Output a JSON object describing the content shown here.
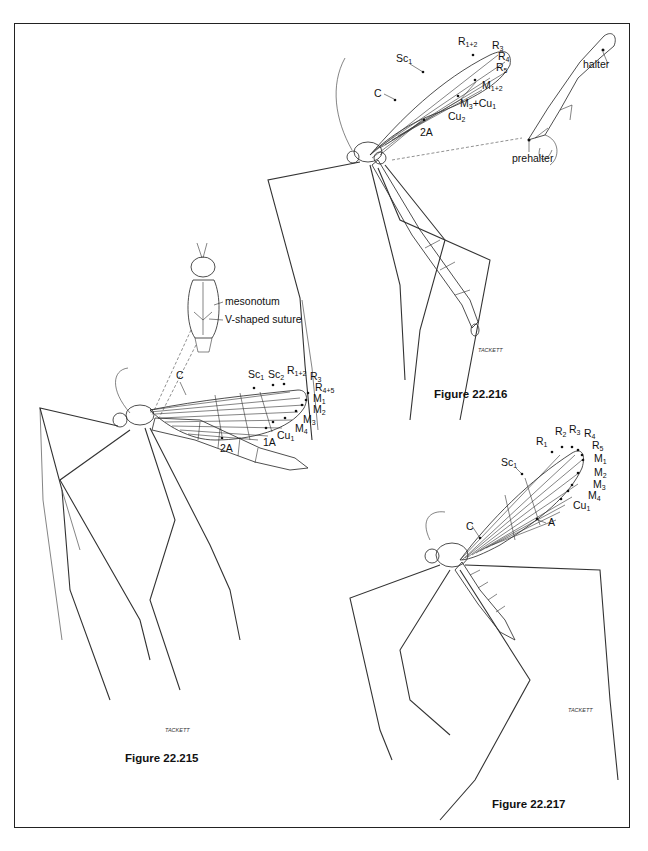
{
  "figures": [
    {
      "id": "fig215",
      "caption": "Figure 22.215",
      "signature": "TACKETT",
      "wing_labels": {
        "C": "C",
        "Sc1": "Sc",
        "Sc1_sub": "1",
        "Sc2": "Sc",
        "Sc2_sub": "2",
        "R12": "R",
        "R12_sub": "1+2",
        "R3": "R",
        "R3_sub": "3",
        "R45": "R",
        "R45_sub": "4+5",
        "M1": "M",
        "M1_sub": "1",
        "M2": "M",
        "M2_sub": "2",
        "M3": "M",
        "M3_sub": "3",
        "M4": "M",
        "M4_sub": "4",
        "Cu1": "Cu",
        "Cu1_sub": "1",
        "A1": "1A",
        "A2": "2A"
      },
      "inset_labels": {
        "mesonotum": "mesonotum",
        "suture": "V-shaped suture"
      }
    },
    {
      "id": "fig216",
      "caption": "Figure 22.216",
      "signature": "TACKETT",
      "wing_labels": {
        "C": "C",
        "Sc1": "Sc",
        "Sc1_sub": "1",
        "R12": "R",
        "R12_sub": "1+2",
        "R3": "R",
        "R3_sub": "3",
        "R4": "R",
        "R4_sub": "4",
        "R5": "R",
        "R5_sub": "5",
        "M12": "M",
        "M12_sub": "1+2",
        "M3Cu1": "M",
        "M3Cu1_sub": "3",
        "M3Cu1_tail": "+Cu",
        "M3Cu1_tail_sub": "1",
        "Cu2": "Cu",
        "Cu2_sub": "2",
        "A2": "2A"
      },
      "inset_labels": {
        "halter": "halter",
        "prehalter": "prehalter"
      }
    },
    {
      "id": "fig217",
      "caption": "Figure 22.217",
      "signature": "TACKETT",
      "wing_labels": {
        "C": "C",
        "Sc1": "Sc",
        "Sc1_sub": "1",
        "R1": "R",
        "R1_sub": "1",
        "R2": "R",
        "R2_sub": "2",
        "R3": "R",
        "R3_sub": "3",
        "R4": "R",
        "R4_sub": "4",
        "R5": "R",
        "R5_sub": "5",
        "M1": "M",
        "M1_sub": "1",
        "M2": "M",
        "M2_sub": "2",
        "M3": "M",
        "M3_sub": "3",
        "M4": "M",
        "M4_sub": "4",
        "Cu1": "Cu",
        "Cu1_sub": "1",
        "A": "A"
      }
    }
  ]
}
